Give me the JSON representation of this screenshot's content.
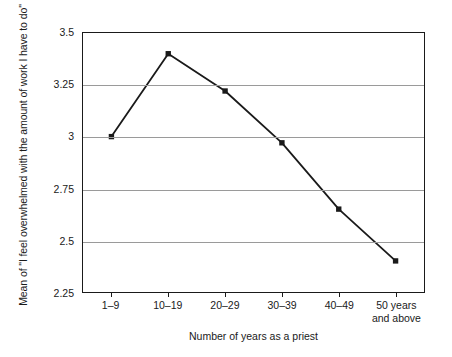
{
  "chart_data": {
    "type": "line",
    "title": "",
    "subtitle": "",
    "xlabel": "Number of years as a priest",
    "ylabel": "Mean of \"I feel overwhelmed with the amount of work I have to do\"",
    "categories": [
      "1–9",
      "10–19",
      "20–29",
      "30–39",
      "40–49",
      "50 years and above"
    ],
    "category_lines": [
      [
        "1–9"
      ],
      [
        "10–19"
      ],
      [
        "20–29"
      ],
      [
        "30–39"
      ],
      [
        "40–49"
      ],
      [
        "50 years",
        "and above"
      ]
    ],
    "values": [
      3.0,
      3.4,
      3.22,
      2.97,
      2.65,
      2.4
    ],
    "ylim": [
      2.25,
      3.5
    ],
    "yticks": [
      3.5,
      3.25,
      3,
      2.75,
      2.5,
      2.25
    ],
    "ytick_labels": [
      "3.5",
      "3.25",
      "3",
      "2.75",
      "2.5",
      "2.25"
    ],
    "grid": true,
    "gridlines_at": [
      3.25,
      3,
      2.75,
      2.5
    ],
    "legend": "none",
    "series": [
      {
        "name": "Mean score",
        "values": [
          3.0,
          3.4,
          3.22,
          2.97,
          2.65,
          2.4
        ],
        "line_color": "#1a1a1a",
        "marker": "square",
        "marker_color": "#1a1a1a"
      }
    ],
    "colors": {
      "line": "#1a1a1a",
      "marker": "#1a1a1a",
      "grid": "#9a9a9a",
      "frame": "#1a1a1a",
      "text": "#1a1a1a",
      "background": "#ffffff"
    }
  }
}
